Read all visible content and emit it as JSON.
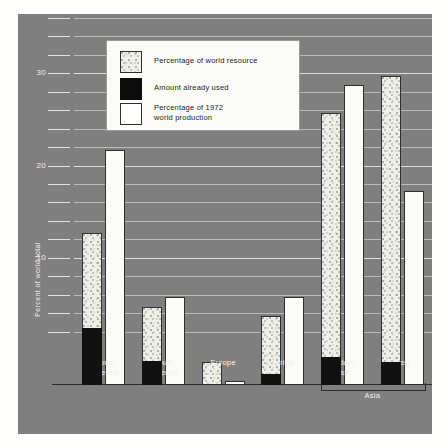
{
  "chart_data": {
    "type": "bar",
    "title": "",
    "xlabel": "",
    "ylabel": "Percent of world total",
    "ylim": [
      0,
      36
    ],
    "yticks": [
      10,
      20,
      30
    ],
    "grid": true,
    "grid_step": 2,
    "legend_position": "top-left",
    "categories": [
      "North America",
      "South America",
      "Europe",
      "Africa",
      "Middle East",
      "Rest"
    ],
    "group_bracket": {
      "label": "Asia",
      "covers": [
        "Middle East",
        "Rest"
      ]
    },
    "series": [
      {
        "name": "Percentage of world resource",
        "values": [
          16.5,
          8.5,
          2.5,
          7.5,
          29.5,
          33.5
        ]
      },
      {
        "name": "Amount already used",
        "values": [
          6.2,
          2.6,
          0.0,
          1.2,
          3.0,
          2.5
        ]
      },
      {
        "name": "Percentage of 1972 world production",
        "values": [
          25.5,
          9.5,
          0.4,
          9.5,
          32.5,
          21.0
        ]
      }
    ]
  },
  "legend": {
    "items": [
      {
        "label": "Percentage of world resource",
        "swatch": "stipple-swatch"
      },
      {
        "label": "Amount already used",
        "swatch": "black-swatch"
      },
      {
        "label": "Percentage of 1972\nworld production",
        "swatch": "white-swatch"
      }
    ]
  },
  "axis": {
    "y_title": "Percent of world total",
    "y_labels": [
      "30",
      "20",
      "10"
    ]
  },
  "x_labels": [
    "North\nAmerica",
    "South\nAmerica",
    "Europe",
    "Africa",
    "Middle\nEast",
    "Rest"
  ],
  "bracket_label": "Asia",
  "colors": {
    "panel_background": "#7f7f7f",
    "gridline": "#cfcfcf",
    "used_bar": "#111111",
    "production_bar": "#fbfbf7",
    "resource_bar": "#f0efe9",
    "axis_line": "#2b2b2b",
    "label_text": "#f2f2f2"
  }
}
